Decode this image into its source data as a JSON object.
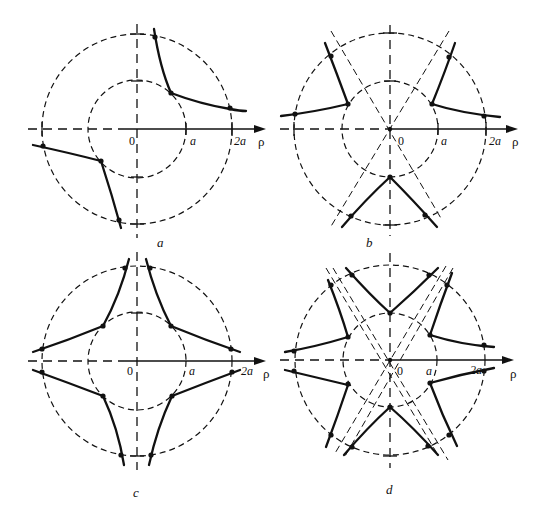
{
  "figure": {
    "panels": [
      {
        "id": "a",
        "caption": "a",
        "axis_labels": {
          "origin": "0",
          "inner": "a",
          "outer": "2a",
          "axis": "ρ"
        },
        "symmetry": "two-fold (curves in quadrants I and III)"
      },
      {
        "id": "b",
        "caption": "b",
        "axis_labels": {
          "origin": "0",
          "inner": "a",
          "outer": "2a",
          "axis": "ρ"
        },
        "symmetry": "three-fold (curves at 120° spacing, dashed lines at ±60°)"
      },
      {
        "id": "c",
        "caption": "c",
        "axis_labels": {
          "origin": "0",
          "inner": "a",
          "outer": "2a",
          "axis": "ρ"
        },
        "symmetry": "four-fold (curves in all four quadrants)"
      },
      {
        "id": "d",
        "caption": "d",
        "axis_labels": {
          "origin": "0",
          "inner": "a",
          "outer": "2a",
          "axis": "ρ"
        },
        "symmetry": "six-fold (curves at 60° spacing, dashed lines at ±60°)"
      }
    ],
    "radii": {
      "inner": "a",
      "outer": "2a"
    },
    "colors": {
      "ink": "#111111",
      "background": "#ffffff"
    }
  }
}
